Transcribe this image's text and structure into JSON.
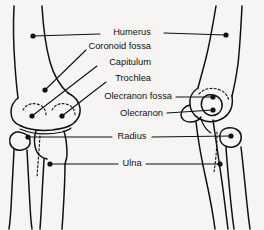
{
  "figure": {
    "background_color": "#f6f5f3",
    "ink_color": "#111111",
    "width": 264,
    "height": 230,
    "views": [
      {
        "name": "anterior-view",
        "side": "left"
      },
      {
        "name": "lateral-view",
        "side": "right"
      }
    ]
  },
  "labels": [
    {
      "id": "humerus",
      "text": "Humerus",
      "x": 132,
      "y": 33,
      "anchor": "middle",
      "leaders": [
        {
          "name": "humerus-leader-left",
          "dot": [
            33,
            36
          ]
        },
        {
          "name": "humerus-leader-right",
          "dot": [
            226,
            35
          ]
        }
      ]
    },
    {
      "id": "coronoid-fossa",
      "text": "Coronoid fossa",
      "x": 151,
      "y": 47,
      "anchor": "end",
      "leaders": [
        {
          "name": "coronoid-fossa-leader",
          "dot": [
            45,
            90
          ]
        }
      ]
    },
    {
      "id": "capitulum",
      "text": "Capitulum",
      "x": 151,
      "y": 63,
      "anchor": "end",
      "leaders": [
        {
          "name": "capitulum-leader",
          "dot": [
            32,
            116
          ]
        }
      ]
    },
    {
      "id": "trochlea",
      "text": "Trochlea",
      "x": 151,
      "y": 79,
      "anchor": "end",
      "leaders": [
        {
          "name": "trochlea-leader",
          "dot": [
            62,
            116
          ]
        }
      ]
    },
    {
      "id": "olecranon-fossa",
      "text": "Olecranon fossa",
      "x": 172,
      "y": 97,
      "anchor": "end",
      "leaders": [
        {
          "name": "olecranon-fossa-leader",
          "dot": [
            213,
            97
          ]
        }
      ]
    },
    {
      "id": "olecranon",
      "text": "Olecranon",
      "x": 163,
      "y": 114,
      "anchor": "end",
      "leaders": [
        {
          "name": "olecranon-leader",
          "dot": [
            213,
            110
          ]
        }
      ]
    },
    {
      "id": "radius",
      "text": "Radius",
      "x": 132,
      "y": 137,
      "anchor": "middle",
      "leaders": [
        {
          "name": "radius-leader-left",
          "dot": [
            28,
            137
          ]
        },
        {
          "name": "radius-leader-right",
          "dot": [
            231,
            136
          ]
        }
      ]
    },
    {
      "id": "ulna",
      "text": "Ulna",
      "x": 132,
      "y": 164,
      "anchor": "middle",
      "leaders": [
        {
          "name": "ulna-leader-left",
          "dot": [
            50,
            164
          ]
        },
        {
          "name": "ulna-leader-right",
          "dot": [
            220,
            164
          ]
        }
      ]
    }
  ]
}
